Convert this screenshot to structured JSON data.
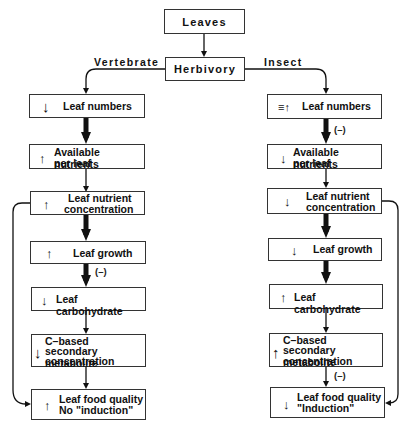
{
  "diagram": {
    "top": {
      "leaves": "Leaves",
      "herbivory": "Herbivory"
    },
    "branches": {
      "left": "Vertebrate",
      "right": "Insect"
    },
    "left_column": [
      {
        "arrow": "↓",
        "line1": "Leaf numbers",
        "line2": ""
      },
      {
        "arrow": "↑",
        "line1": "Available nutrients",
        "line2": "per leaf"
      },
      {
        "arrow": "↑",
        "line1": "Leaf nutrient",
        "line2": "concentration"
      },
      {
        "arrow": "↑",
        "line1": "Leaf growth",
        "line2": ""
      },
      {
        "arrow": "↓",
        "line1": "Leaf carbohydrate",
        "line2": ""
      },
      {
        "arrow": "↓",
        "line1": "C–based",
        "line2": "secondary metabolite",
        "line3": "concentration"
      },
      {
        "arrow": "↑",
        "line1": "Leaf food quality",
        "line2": "No \"induction\""
      }
    ],
    "right_column": [
      {
        "arrow": "≡↑",
        "line1": "Leaf numbers",
        "line2": ""
      },
      {
        "arrow": "↓",
        "line1": "Available nutrients",
        "line2": "per leaf"
      },
      {
        "arrow": "↓",
        "line1": "Leaf nutrient",
        "line2": "concentration"
      },
      {
        "arrow": "↓",
        "line1": "Leaf growth",
        "line2": ""
      },
      {
        "arrow": "↑",
        "line1": "Leaf carbohydrate",
        "line2": ""
      },
      {
        "arrow": "↑",
        "line1": "C–based",
        "line2": "secondary metabolite",
        "line3": "concentration"
      },
      {
        "arrow": "↓",
        "line1": "Leaf food quality",
        "line2": "\"Induction\""
      }
    ],
    "negative_labels": {
      "left_growth_to_carb": "(–)",
      "right_numbers_to_nutrients": "(–)",
      "right_metabolite_to_quality": "(–)"
    }
  }
}
